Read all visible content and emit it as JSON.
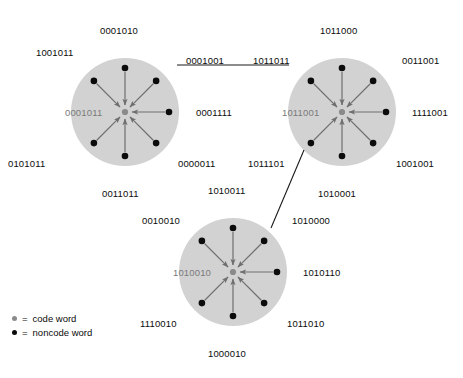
{
  "figure": {
    "background_color": "#ffffff",
    "sphere_fill": "#d2d2d2",
    "codeword_color": "#8a8a8a",
    "noncode_color": "#0b0b0b",
    "arrow_color": "#6e6e6e",
    "link_color": "#1a1a1a",
    "center_label_color": "#7a7a7a"
  },
  "legend": {
    "equals": "=",
    "items": [
      {
        "marker": "code-word-dot",
        "symbol": "=",
        "label": "code word"
      },
      {
        "marker": "noncode-word-dot",
        "symbol": "=",
        "label": "noncode word"
      }
    ]
  },
  "spheres": [
    {
      "id": "sphere-1",
      "cx": 125,
      "cy": 112,
      "r": 54,
      "center_word": "0001011",
      "center_label_x": 65,
      "center_label_y": 107,
      "neighbors": [
        {
          "word": "0001010",
          "angle": -90,
          "label_x": 100,
          "label_y": 25,
          "label_align": "left"
        },
        {
          "word": "0001001",
          "angle": -45,
          "label_x": 186,
          "label_y": 55,
          "label_align": "left"
        },
        {
          "word": "0001111",
          "angle": 0,
          "label_x": 196,
          "label_y": 107,
          "label_align": "left"
        },
        {
          "word": "0000011",
          "angle": 45,
          "label_x": 178,
          "label_y": 158,
          "label_align": "left"
        },
        {
          "word": "0011011",
          "angle": 90,
          "label_x": 102,
          "label_y": 188,
          "label_align": "left"
        },
        {
          "word": "0101011",
          "angle": 135,
          "label_x": 8,
          "label_y": 158,
          "label_align": "left"
        },
        {
          "word": "1001011",
          "angle": -135,
          "label_x": 36,
          "label_y": 47,
          "label_align": "left"
        }
      ]
    },
    {
      "id": "sphere-2",
      "cx": 342,
      "cy": 112,
      "r": 54,
      "center_word": "1011001",
      "center_label_x": 282,
      "center_label_y": 107,
      "neighbors": [
        {
          "word": "1011000",
          "angle": -90,
          "label_x": 320,
          "label_y": 25,
          "label_align": "left"
        },
        {
          "word": "0011001",
          "angle": -45,
          "label_x": 402,
          "label_y": 55,
          "label_align": "left"
        },
        {
          "word": "1111001",
          "angle": 0,
          "label_x": 412,
          "label_y": 107,
          "label_align": "left"
        },
        {
          "word": "1001001",
          "angle": 45,
          "label_x": 396,
          "label_y": 158,
          "label_align": "left"
        },
        {
          "word": "1010001",
          "angle": 90,
          "label_x": 318,
          "label_y": 188,
          "label_align": "left"
        },
        {
          "word": "1011101",
          "angle": 135,
          "label_x": 248,
          "label_y": 158,
          "label_align": "left"
        },
        {
          "word": "1011011",
          "angle": -135,
          "label_x": 253,
          "label_y": 55,
          "label_align": "left"
        }
      ]
    },
    {
      "id": "sphere-3",
      "cx": 233,
      "cy": 272,
      "r": 54,
      "center_word": "1010010",
      "center_label_x": 173,
      "center_label_y": 267,
      "neighbors": [
        {
          "word": "1010011",
          "angle": -90,
          "label_x": 208,
          "label_y": 185,
          "label_align": "left"
        },
        {
          "word": "1010000",
          "angle": -45,
          "label_x": 292,
          "label_y": 215,
          "label_align": "left"
        },
        {
          "word": "1010110",
          "angle": 0,
          "label_x": 303,
          "label_y": 267,
          "label_align": "left"
        },
        {
          "word": "1011010",
          "angle": 45,
          "label_x": 287,
          "label_y": 318,
          "label_align": "left"
        },
        {
          "word": "1000010",
          "angle": 90,
          "label_x": 208,
          "label_y": 348,
          "label_align": "left"
        },
        {
          "word": "1110010",
          "angle": 135,
          "label_x": 140,
          "label_y": 318,
          "label_align": "left"
        },
        {
          "word": "0010010",
          "angle": -135,
          "label_x": 142,
          "label_y": 215,
          "label_align": "left"
        }
      ]
    }
  ],
  "links": [
    {
      "from": "0001001",
      "to": "1011011",
      "x1": 177,
      "y1": 65,
      "x2": 289,
      "y2": 65
    },
    {
      "from": "1011101",
      "to": "1010000",
      "x1": 304,
      "y1": 150,
      "x2": 271,
      "y2": 228
    }
  ]
}
